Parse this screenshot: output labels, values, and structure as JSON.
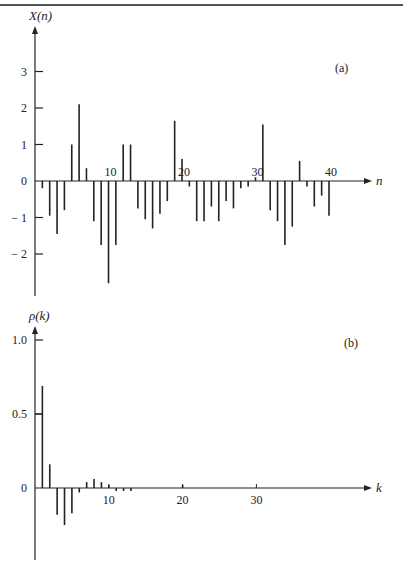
{
  "chart_data": [
    {
      "type": "stem",
      "panel_label": "(a)",
      "title": "",
      "xlabel": "n",
      "ylabel": "X(n)",
      "xlim": [
        0,
        42
      ],
      "ylim": [
        -3.2,
        3.8
      ],
      "y_ticks": [
        3,
        2,
        1,
        0,
        -1,
        -2
      ],
      "y_tick_labels": [
        "3",
        "2",
        "1",
        "0",
        "-1",
        "-2"
      ],
      "x_tick_labels": [
        "10",
        "20",
        "30",
        "40"
      ],
      "x_ticks": [
        10,
        20,
        30,
        40
      ],
      "grid": false,
      "x": [
        1,
        2,
        3,
        4,
        5,
        6,
        7,
        8,
        9,
        10,
        11,
        12,
        13,
        14,
        15,
        16,
        17,
        18,
        19,
        20,
        21,
        22,
        23,
        24,
        25,
        26,
        27,
        28,
        29,
        30,
        31,
        32,
        33,
        34,
        35,
        36,
        37,
        38,
        39,
        40
      ],
      "values": [
        -0.2,
        -0.95,
        -1.45,
        -0.8,
        1.0,
        2.1,
        0.35,
        -1.1,
        -1.75,
        -2.8,
        -1.75,
        1.0,
        1.0,
        -0.75,
        -1.05,
        -1.3,
        -0.9,
        -0.55,
        1.65,
        0.6,
        -0.15,
        -1.1,
        -1.1,
        -0.7,
        -1.1,
        -0.55,
        -0.75,
        -0.2,
        -0.15,
        0.1,
        1.55,
        -0.8,
        -1.1,
        -1.75,
        -1.25,
        0.55,
        -0.15,
        -0.7,
        -0.4,
        -0.95
      ]
    },
    {
      "type": "stem",
      "panel_label": "(b)",
      "title": "",
      "xlabel": "k",
      "ylabel": "ρ(k)",
      "xlim": [
        0,
        42
      ],
      "ylim": [
        -0.45,
        1.15
      ],
      "y_ticks": [
        1.0,
        0.5,
        0
      ],
      "y_tick_labels": [
        "1.0",
        "0.5",
        "0"
      ],
      "x_ticks": [
        10,
        20,
        30
      ],
      "x_tick_labels": [
        "10",
        "20",
        "30"
      ],
      "grid": false,
      "x": [
        1,
        2,
        3,
        4,
        5,
        6,
        7,
        8,
        9,
        10,
        11,
        12,
        13,
        20
      ],
      "values": [
        0.69,
        0.16,
        -0.18,
        -0.25,
        -0.17,
        -0.03,
        0.04,
        0.06,
        0.04,
        0.02,
        -0.02,
        -0.02,
        -0.02,
        0.02
      ]
    }
  ]
}
